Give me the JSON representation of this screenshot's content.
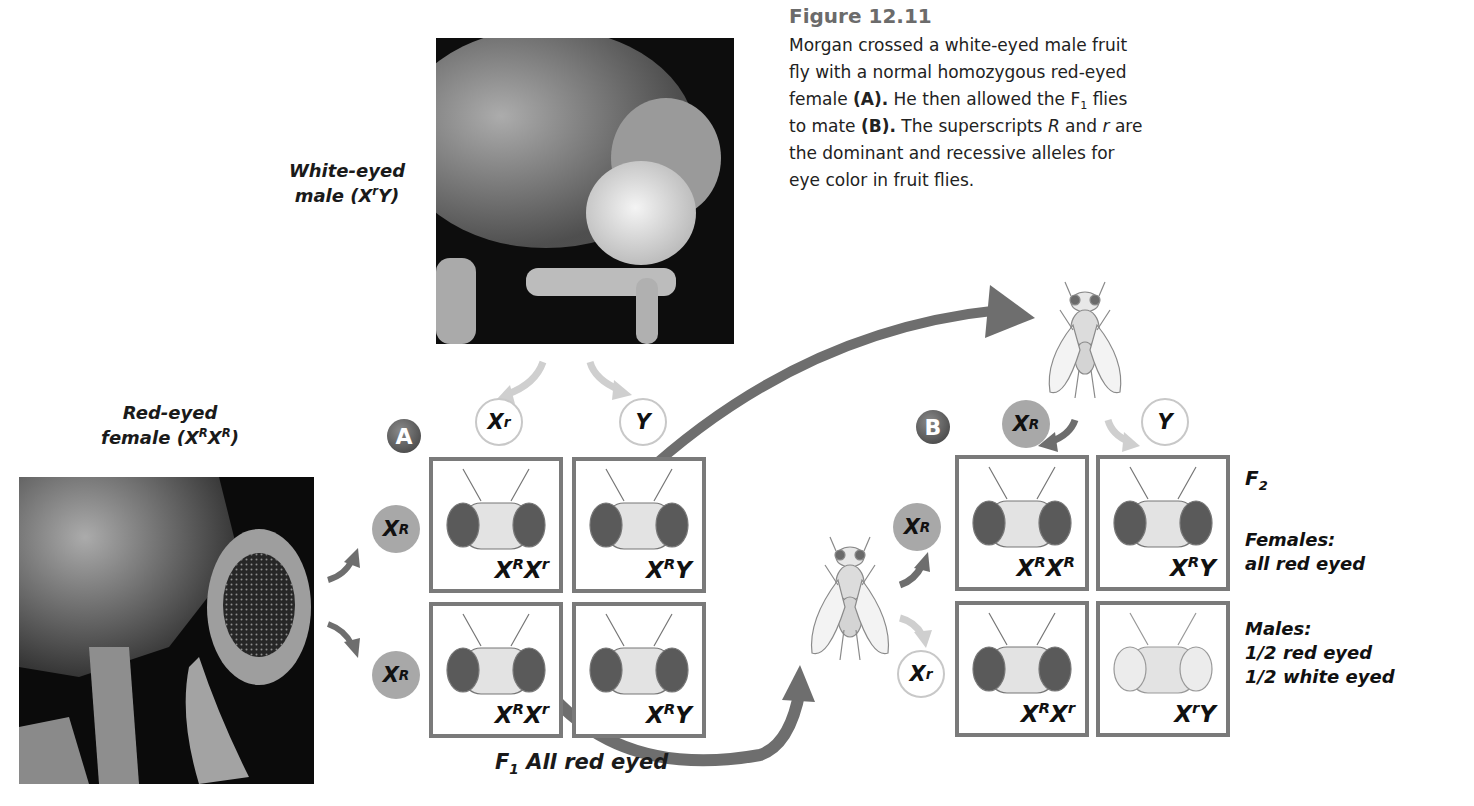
{
  "figure": {
    "number": "Figure 12.11",
    "caption_parts": {
      "p1": "Morgan crossed a white-eyed male fruit fly with a normal homozygous red-eyed female ",
      "a": "(A).",
      "p2": " He then allowed the F",
      "sub1": "1",
      "p3": " flies to mate ",
      "b": "(B).",
      "p4": " The superscripts ",
      "R": "R",
      "p5": " and ",
      "r": "r",
      "p6": " are the dominant and recessive alleles for eye color in fruit flies."
    }
  },
  "parents": {
    "male": {
      "line1": "White-eyed",
      "line2_pre": "male (X",
      "line2_sup": "r",
      "line2_post": "Y)"
    },
    "female": {
      "line1": "Red-eyed",
      "line2_pre": "female (X",
      "sup1": "R",
      "mid": "X",
      "sup2": "R",
      "line2_post": ")"
    }
  },
  "cross_a": {
    "badge": "A",
    "top_gametes": [
      {
        "base": "X",
        "sup": "r",
        "type": "white"
      },
      {
        "base": "Y",
        "sup": "",
        "type": "white"
      }
    ],
    "side_gametes": [
      {
        "base": "X",
        "sup": "R",
        "type": "red"
      },
      {
        "base": "X",
        "sup": "R",
        "type": "red"
      }
    ],
    "cells": [
      {
        "a": "X",
        "as": "R",
        "b": "X",
        "bs": "r",
        "eyes": "red"
      },
      {
        "a": "X",
        "as": "R",
        "b": "Y",
        "bs": "",
        "eyes": "red"
      },
      {
        "a": "X",
        "as": "R",
        "b": "X",
        "bs": "r",
        "eyes": "red"
      },
      {
        "a": "X",
        "as": "R",
        "b": "Y",
        "bs": "",
        "eyes": "red"
      }
    ],
    "result_pre": "F",
    "result_sub": "1",
    "result_post": " All red eyed"
  },
  "cross_b": {
    "badge": "B",
    "top_gametes": [
      {
        "base": "X",
        "sup": "R",
        "type": "red"
      },
      {
        "base": "Y",
        "sup": "",
        "type": "white"
      }
    ],
    "side_gametes": [
      {
        "base": "X",
        "sup": "R",
        "type": "red"
      },
      {
        "base": "X",
        "sup": "r",
        "type": "white"
      }
    ],
    "cells": [
      {
        "a": "X",
        "as": "R",
        "b": "X",
        "bs": "R",
        "eyes": "red"
      },
      {
        "a": "X",
        "as": "R",
        "b": "Y",
        "bs": "",
        "eyes": "red"
      },
      {
        "a": "X",
        "as": "R",
        "b": "X",
        "bs": "r",
        "eyes": "red"
      },
      {
        "a": "X",
        "as": "r",
        "b": "Y",
        "bs": "",
        "eyes": "white"
      }
    ],
    "f2_label": "F",
    "f2_sub": "2",
    "females_title": "Females:",
    "females_value": "all red eyed",
    "males_title": "Males:",
    "males_line1": "1/2 red eyed",
    "males_line2": "1/2 white eyed"
  },
  "colors": {
    "arrow": "#6e6e6e",
    "cell_border": "#7a7a7a",
    "red_gamete": "#a8a8a8",
    "red_eye": "#5a5a5a",
    "white_eye": "#ececec",
    "caption_title": "#6b6b6b"
  }
}
